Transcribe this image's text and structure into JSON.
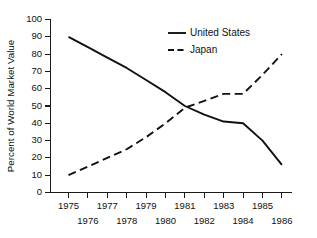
{
  "chart_data": {
    "type": "line",
    "title": "",
    "xlabel": "",
    "ylabel": "Percent of World Market Value",
    "ylim": [
      0,
      100
    ],
    "ytick_step": 10,
    "yticks": [
      "0",
      "10",
      "20",
      "30",
      "40",
      "50",
      "60",
      "70",
      "80",
      "90",
      "100"
    ],
    "x": [
      1975,
      1976,
      1977,
      1978,
      1979,
      1980,
      1981,
      1982,
      1983,
      1984,
      1985,
      1986
    ],
    "xticks_upper": [
      "1975",
      "1977",
      "1979",
      "1981",
      "1983",
      "1985"
    ],
    "xticks_lower": [
      "1976",
      "1978",
      "1980",
      "1982",
      "1984",
      "1986"
    ],
    "xtick_labels": [
      "1975",
      "1976",
      "1977",
      "1978",
      "1979",
      "1980",
      "1981",
      "1982",
      "1983",
      "1984",
      "1985",
      "1986"
    ],
    "grid": false,
    "legend_position": "top-center",
    "series": [
      {
        "name": "United States",
        "style": "solid",
        "color": "#111111",
        "values": [
          90,
          84,
          78,
          72,
          65,
          58,
          50,
          45,
          41,
          40,
          30,
          16
        ]
      },
      {
        "name": "Japan",
        "style": "dashed",
        "color": "#111111",
        "values": [
          10,
          15,
          20,
          25,
          32,
          40,
          49,
          53,
          57,
          57,
          68,
          80
        ]
      }
    ],
    "annotations": [
      "Lines cross near 1981 at about 50 percent"
    ]
  },
  "legend": {
    "entries": [
      {
        "label": "United States",
        "style": "solid"
      },
      {
        "label": "Japan",
        "style": "dashed"
      }
    ]
  }
}
